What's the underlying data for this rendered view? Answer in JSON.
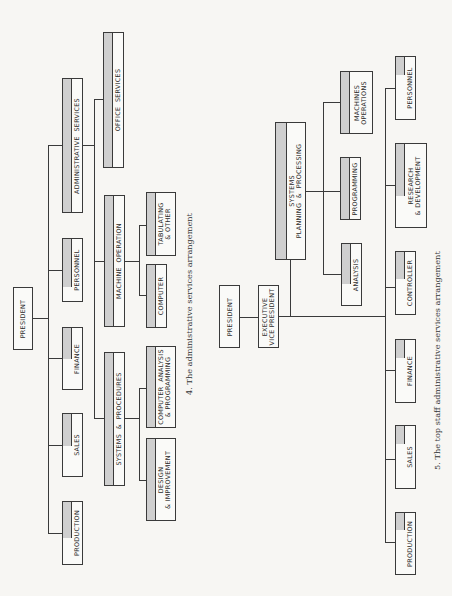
{
  "figure4": {
    "caption": "4.  The administrative services arrangement",
    "president": "PRESIDENT",
    "level1": [
      {
        "label": "ADMINISTRATIVE  SERVICES"
      },
      {
        "label": "PERSONNEL"
      },
      {
        "label": "FINANCE"
      },
      {
        "label": "SALES"
      },
      {
        "label": "PRODUCTION"
      }
    ],
    "admin_children": [
      {
        "label": "OFFICE  SERVICES"
      },
      {
        "label": "MACHINE  OPERATION"
      },
      {
        "label": "SYSTEMS  &  PROCEDURES"
      }
    ],
    "machine_children": [
      {
        "label": "TABULATING\n& OTHER"
      },
      {
        "label": "COMPUTER"
      }
    ],
    "systems_children": [
      {
        "label": "COMPUTER  ANALYSIS\n& PROGRAMMING"
      },
      {
        "label": "DESIGN\n& IMPROVEMENT"
      }
    ]
  },
  "figure5": {
    "caption": "5.  The top staff administrative services arrangement",
    "president": "PRESIDENT",
    "executive_vp": "EXECUTIVE\nVICE PRESIDENT",
    "systems": "SYSTEMS\nPLANNING  &  PROCESSING",
    "systems_children": [
      {
        "label": "MACHINES\nOPERATIONS"
      },
      {
        "label": "PROGRAMMING"
      },
      {
        "label": "ANALYSIS"
      }
    ],
    "level1": [
      {
        "label": "PERSONNEL"
      },
      {
        "label": "RESEARCH\n& DEVELOPMENT"
      },
      {
        "label": "CONTROLLER"
      },
      {
        "label": "FINANCE"
      },
      {
        "label": "SALES"
      },
      {
        "label": "PRODUCTION"
      }
    ]
  }
}
